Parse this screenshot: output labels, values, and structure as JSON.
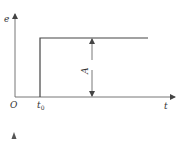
{
  "diagram": {
    "type": "step-function",
    "y_axis_label": "e",
    "x_axis_label": "t",
    "origin_label": "O",
    "step_time_label": "t",
    "step_time_subscript": "0",
    "amplitude_label": "A",
    "colors": {
      "line": "#444444",
      "axis": "#555555",
      "background": "#ffffff"
    }
  }
}
